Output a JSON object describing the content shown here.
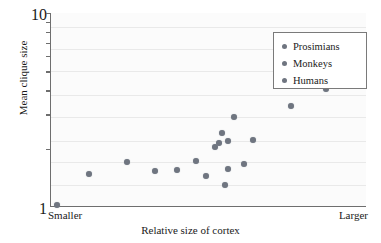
{
  "chart_data": {
    "type": "scatter",
    "title": "",
    "xlabel": "Relative size of cortex",
    "ylabel": "Mean clique size",
    "yscale": "log",
    "ylim": [
      1,
      10
    ],
    "ytick_labels": [
      "10",
      "1"
    ],
    "x_endpoint_labels": {
      "left": "Smaller",
      "right": "Larger"
    },
    "xticks_numeric": false,
    "grid": "horizontal-faint",
    "legend_position": "top-right",
    "series": [
      {
        "name": "Prosimians",
        "color": "#6f7580"
      },
      {
        "name": "Monkeys",
        "color": "#6f7580"
      },
      {
        "name": "Humans",
        "color": "#6f7580"
      }
    ],
    "points": [
      {
        "series": "Prosimians",
        "x": 0.02,
        "y": 1.03
      },
      {
        "series": "Prosimians",
        "x": 0.12,
        "y": 1.48
      },
      {
        "series": "Prosimians",
        "x": 0.24,
        "y": 1.7
      },
      {
        "series": "Monkeys",
        "x": 0.33,
        "y": 1.54
      },
      {
        "series": "Monkeys",
        "x": 0.4,
        "y": 1.55
      },
      {
        "series": "Monkeys",
        "x": 0.46,
        "y": 1.72
      },
      {
        "series": "Monkeys",
        "x": 0.49,
        "y": 1.44
      },
      {
        "series": "Monkeys",
        "x": 0.52,
        "y": 2.05
      },
      {
        "series": "Monkeys",
        "x": 0.53,
        "y": 2.15
      },
      {
        "series": "Monkeys",
        "x": 0.54,
        "y": 2.42
      },
      {
        "series": "Monkeys",
        "x": 0.55,
        "y": 1.3
      },
      {
        "series": "Monkeys",
        "x": 0.56,
        "y": 2.2
      },
      {
        "series": "Monkeys",
        "x": 0.56,
        "y": 1.58
      },
      {
        "series": "Monkeys",
        "x": 0.58,
        "y": 2.92
      },
      {
        "series": "Monkeys",
        "x": 0.61,
        "y": 1.67
      },
      {
        "series": "Monkeys",
        "x": 0.64,
        "y": 2.21
      },
      {
        "series": "Monkeys",
        "x": 0.76,
        "y": 3.3
      },
      {
        "series": "Humans",
        "x": 0.87,
        "y": 4.05
      }
    ],
    "gridline_values": [
      1.3,
      1.7,
      2.2,
      2.9,
      3.8,
      5.0,
      6.5,
      8.5
    ]
  },
  "axes": {
    "y_top_label": "10",
    "y_bottom_label": "1",
    "y_axis_title": "Mean clique size",
    "x_axis_title": "Relative size of cortex",
    "x_left_label": "Smaller",
    "x_right_label": "Larger"
  },
  "legend": {
    "entries": [
      {
        "label": "Prosimians"
      },
      {
        "label": "Monkeys"
      },
      {
        "label": "Humans"
      }
    ]
  }
}
